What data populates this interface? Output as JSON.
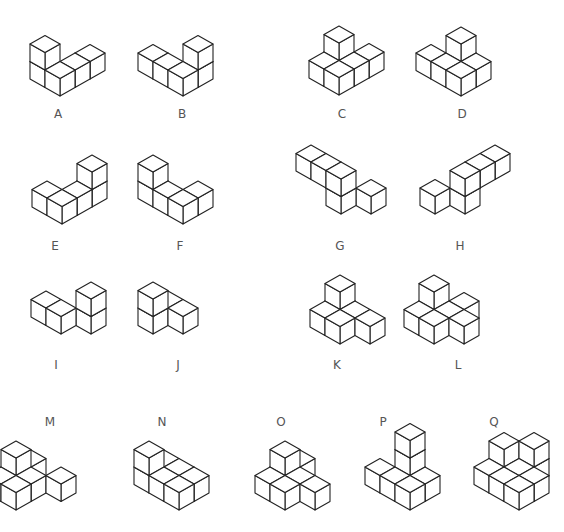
{
  "diagram": {
    "title": "",
    "stroke_color": "#222222",
    "background": "#ffffff",
    "cube": {
      "dx": 15,
      "dy": 8.5,
      "dz": 17.5
    },
    "figures": [
      {
        "label": "A",
        "label_pos": [
          58,
          114
        ],
        "origin": [
          60,
          96
        ],
        "cubes": [
          [
            0,
            1,
            0
          ],
          [
            0,
            1,
            1
          ],
          [
            2,
            0,
            0
          ],
          [
            1,
            0,
            0
          ],
          [
            0,
            0,
            0
          ]
        ]
      },
      {
        "label": "B",
        "label_pos": [
          182,
          114
        ],
        "origin": [
          183,
          96
        ],
        "cubes": [
          [
            0,
            2,
            0
          ],
          [
            0,
            1,
            0
          ],
          [
            1,
            0,
            0
          ],
          [
            1,
            0,
            1
          ],
          [
            0,
            0,
            0
          ]
        ]
      },
      {
        "label": "C",
        "label_pos": [
          342,
          114
        ],
        "origin": [
          339,
          95
        ],
        "cubes": [
          [
            1,
            1,
            0
          ],
          [
            0,
            1,
            0
          ],
          [
            2,
            0,
            0
          ],
          [
            1,
            0,
            0
          ],
          [
            1,
            1,
            1
          ],
          [
            0,
            0,
            0
          ]
        ]
      },
      {
        "label": "D",
        "label_pos": [
          462,
          114
        ],
        "origin": [
          461,
          96
        ],
        "cubes": [
          [
            1,
            1,
            0
          ],
          [
            0,
            2,
            0
          ],
          [
            0,
            1,
            0
          ],
          [
            1,
            1,
            1
          ],
          [
            1,
            0,
            0
          ],
          [
            0,
            0,
            0
          ]
        ]
      },
      {
        "label": "E",
        "label_pos": [
          55,
          246
        ],
        "origin": [
          62,
          224
        ],
        "cubes": [
          [
            0,
            1,
            0
          ],
          [
            2,
            0,
            0
          ],
          [
            2,
            0,
            1
          ],
          [
            1,
            0,
            0
          ],
          [
            0,
            0,
            0
          ]
        ]
      },
      {
        "label": "F",
        "label_pos": [
          180,
          246
        ],
        "origin": [
          183,
          224
        ],
        "cubes": [
          [
            0,
            2,
            0
          ],
          [
            0,
            2,
            1
          ],
          [
            1,
            0,
            0
          ],
          [
            0,
            1,
            0
          ],
          [
            0,
            0,
            0
          ]
        ]
      },
      {
        "label": "G",
        "label_pos": [
          340,
          246
        ],
        "origin": [
          341,
          214
        ],
        "cubes": [
          [
            0,
            2,
            1
          ],
          [
            0,
            1,
            1
          ],
          [
            1,
            -1,
            0
          ],
          [
            0,
            0,
            0
          ],
          [
            0,
            0,
            1
          ]
        ]
      },
      {
        "label": "H",
        "label_pos": [
          460,
          246
        ],
        "origin": [
          465,
          214
        ],
        "cubes": [
          [
            2,
            0,
            1
          ],
          [
            1,
            0,
            1
          ],
          [
            -1,
            1,
            0
          ],
          [
            0,
            0,
            0
          ],
          [
            0,
            0,
            1
          ]
        ]
      },
      {
        "label": "I",
        "label_pos": [
          56,
          365
        ],
        "origin": [
          61,
          334
        ],
        "cubes": [
          [
            0,
            1,
            0
          ],
          [
            1,
            -1,
            0
          ],
          [
            1,
            -1,
            1
          ],
          [
            0,
            0,
            0
          ]
        ]
      },
      {
        "label": "J",
        "label_pos": [
          178,
          365
        ],
        "origin": [
          153,
          334
        ],
        "cubes": [
          [
            1,
            0,
            0
          ],
          [
            0,
            0,
            0
          ],
          [
            0,
            0,
            1
          ],
          [
            1,
            -1,
            0
          ]
        ]
      },
      {
        "label": "K",
        "label_pos": [
          337,
          365
        ],
        "origin": [
          340,
          344
        ],
        "cubes": [
          [
            1,
            1,
            0
          ],
          [
            0,
            1,
            0
          ],
          [
            1,
            1,
            1
          ],
          [
            1,
            0,
            0
          ],
          [
            0,
            0,
            0
          ],
          [
            1,
            -1,
            0
          ]
        ]
      },
      {
        "label": "L",
        "label_pos": [
          458,
          365
        ],
        "origin": [
          434,
          344
        ],
        "cubes": [
          [
            1,
            1,
            0
          ],
          [
            2,
            0,
            0
          ],
          [
            1,
            1,
            1
          ],
          [
            0,
            1,
            0
          ],
          [
            0,
            0,
            0
          ],
          [
            1,
            0,
            0
          ],
          [
            1,
            -1,
            0
          ]
        ]
      },
      {
        "label": "M",
        "label_pos": [
          50,
          422
        ],
        "origin": [
          16,
          510
        ],
        "cubes": [
          [
            1,
            1,
            0
          ],
          [
            2,
            1,
            0
          ],
          [
            1,
            1,
            1
          ],
          [
            0,
            1,
            0
          ],
          [
            1,
            0,
            0
          ],
          [
            0,
            0,
            0
          ],
          [
            2,
            -1,
            0
          ]
        ]
      },
      {
        "label": "N",
        "label_pos": [
          162,
          422
        ],
        "origin": [
          179,
          510
        ],
        "cubes": [
          [
            1,
            2,
            0
          ],
          [
            1,
            1,
            0
          ],
          [
            0,
            2,
            0
          ],
          [
            0,
            2,
            1
          ],
          [
            1,
            0,
            0
          ],
          [
            0,
            1,
            0
          ],
          [
            0,
            0,
            0
          ]
        ]
      },
      {
        "label": "O",
        "label_pos": [
          281,
          422
        ],
        "origin": [
          285,
          510
        ],
        "cubes": [
          [
            2,
            1,
            0
          ],
          [
            1,
            1,
            0
          ],
          [
            1,
            1,
            1
          ],
          [
            0,
            1,
            0
          ],
          [
            1,
            0,
            0
          ],
          [
            0,
            0,
            0
          ],
          [
            1,
            -1,
            0
          ]
        ]
      },
      {
        "label": "P",
        "label_pos": [
          383,
          422
        ],
        "origin": [
          410,
          510
        ],
        "cubes": [
          [
            1,
            1,
            0
          ],
          [
            1,
            1,
            1
          ],
          [
            1,
            1,
            2
          ],
          [
            1,
            0,
            0
          ],
          [
            0,
            2,
            0
          ],
          [
            0,
            1,
            0
          ],
          [
            0,
            0,
            0
          ]
        ]
      },
      {
        "label": "Q",
        "label_pos": [
          494,
          422
        ],
        "origin": [
          519,
          510
        ],
        "cubes": [
          [
            1,
            2,
            0
          ],
          [
            1,
            2,
            1
          ],
          [
            1,
            1,
            0
          ],
          [
            0,
            2,
            0
          ],
          [
            2,
            1,
            0
          ],
          [
            2,
            1,
            1
          ],
          [
            1,
            0,
            0
          ],
          [
            0,
            1,
            0
          ],
          [
            0,
            0,
            0
          ]
        ]
      }
    ]
  }
}
